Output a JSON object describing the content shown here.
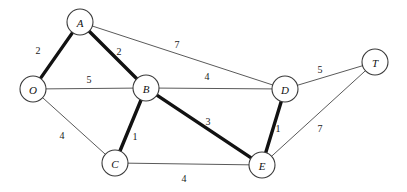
{
  "diagram": {
    "type": "node-link-graph",
    "canvas": {
      "width": 407,
      "height": 192,
      "background": "#ffffff"
    },
    "styles": {
      "node_fill": "#ffffff",
      "node_stroke": "#3a3a3a",
      "node_radius": 13,
      "edge_thin_color": "#5a5a5a",
      "edge_bold_color": "#121212",
      "edge_thin_width": 1,
      "edge_bold_width": 3.4,
      "label_color": "#111111"
    },
    "nodes": [
      {
        "id": "A",
        "label": "A",
        "x": 80,
        "y": 22
      },
      {
        "id": "O",
        "label": "O",
        "x": 33,
        "y": 89
      },
      {
        "id": "B",
        "label": "B",
        "x": 146,
        "y": 88
      },
      {
        "id": "D",
        "label": "D",
        "x": 285,
        "y": 89
      },
      {
        "id": "T",
        "label": "T",
        "x": 375,
        "y": 62
      },
      {
        "id": "C",
        "label": "C",
        "x": 115,
        "y": 163
      },
      {
        "id": "E",
        "label": "E",
        "x": 262,
        "y": 165
      }
    ],
    "edges": [
      {
        "id": "O-A",
        "from": "O",
        "to": "A",
        "weight": "2",
        "emphasis": "bold",
        "label_x": 38,
        "label_y": 50
      },
      {
        "id": "A-B",
        "from": "A",
        "to": "B",
        "weight": "2",
        "emphasis": "bold",
        "label_x": 119,
        "label_y": 51
      },
      {
        "id": "A-D",
        "from": "A",
        "to": "D",
        "weight": "7",
        "emphasis": "thin",
        "label_x": 177,
        "label_y": 44
      },
      {
        "id": "O-B",
        "from": "O",
        "to": "B",
        "weight": "5",
        "emphasis": "thin",
        "label_x": 89,
        "label_y": 79
      },
      {
        "id": "B-D",
        "from": "B",
        "to": "D",
        "weight": "4",
        "emphasis": "thin",
        "label_x": 207,
        "label_y": 76
      },
      {
        "id": "D-T",
        "from": "D",
        "to": "T",
        "weight": "5",
        "emphasis": "thin",
        "label_x": 320,
        "label_y": 69
      },
      {
        "id": "O-C",
        "from": "O",
        "to": "C",
        "weight": "4",
        "emphasis": "thin",
        "label_x": 62,
        "label_y": 135
      },
      {
        "id": "B-C",
        "from": "B",
        "to": "C",
        "weight": "1",
        "emphasis": "bold",
        "label_x": 135,
        "label_y": 136
      },
      {
        "id": "B-E",
        "from": "B",
        "to": "E",
        "weight": "3",
        "emphasis": "bold",
        "label_x": 208,
        "label_y": 121
      },
      {
        "id": "C-E",
        "from": "C",
        "to": "E",
        "weight": "4",
        "emphasis": "thin",
        "label_x": 184,
        "label_y": 178
      },
      {
        "id": "D-E",
        "from": "D",
        "to": "E",
        "weight": "1",
        "emphasis": "bold",
        "label_x": 278,
        "label_y": 128
      },
      {
        "id": "E-T",
        "from": "E",
        "to": "T",
        "weight": "7",
        "emphasis": "thin",
        "label_x": 320,
        "label_y": 128
      }
    ]
  }
}
